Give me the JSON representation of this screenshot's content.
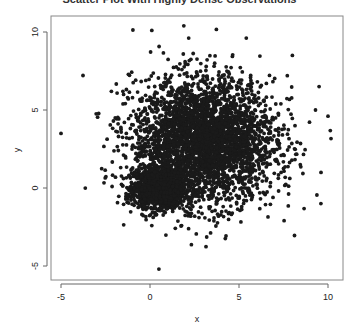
{
  "chart_data": {
    "type": "scatter",
    "title": "Scatter Plot With Highly Dense Observations",
    "xlabel": "x",
    "ylabel": "y",
    "xlim": [
      -5.5,
      10.8
    ],
    "ylim": [
      -5.6,
      11.1
    ],
    "x_ticks": [
      -5,
      0,
      5,
      10
    ],
    "y_ticks": [
      -5,
      0,
      5,
      10
    ],
    "grid": false,
    "legend": null,
    "point_color": "#1a1a1a",
    "clusters": [
      {
        "name": "dense-core",
        "center": [
          0.5,
          0.0
        ],
        "sd": [
          0.7,
          0.6
        ],
        "n": 1500
      },
      {
        "name": "broad-cloud",
        "center": [
          3.0,
          3.0
        ],
        "sd": [
          2.0,
          2.0
        ],
        "n": 3500
      }
    ],
    "notable_points": [
      {
        "x": -5.0,
        "y": 3.5
      },
      {
        "x": 0.1,
        "y": 10.1
      },
      {
        "x": 1.9,
        "y": 10.4
      },
      {
        "x": 0.5,
        "y": -5.2
      },
      {
        "x": 10.0,
        "y": 4.6
      },
      {
        "x": 9.6,
        "y": -1.0
      },
      {
        "x": 9.5,
        "y": 6.5
      },
      {
        "x": 9.3,
        "y": 5.0
      },
      {
        "x": 8.0,
        "y": 8.5
      }
    ]
  }
}
